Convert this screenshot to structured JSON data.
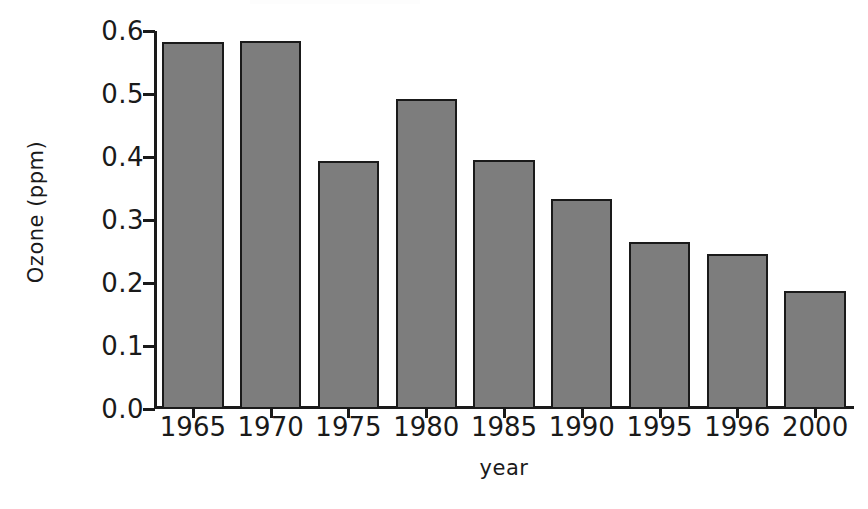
{
  "chart_data": {
    "type": "bar",
    "title": "",
    "xlabel": "year",
    "ylabel": "Ozone (ppm)",
    "categories": [
      "1965",
      "1970",
      "1975",
      "1980",
      "1985",
      "1990",
      "1995",
      "1996",
      "2000"
    ],
    "values": [
      0.583,
      0.584,
      0.393,
      0.492,
      0.395,
      0.334,
      0.265,
      0.246,
      0.187
    ],
    "ylim": [
      0.0,
      0.6
    ],
    "ytick_labels": [
      "0.6",
      "0.5",
      "0.4",
      "0.3",
      "0.2",
      "0.1",
      "0.0"
    ],
    "ytick_values": [
      0.6,
      0.5,
      0.4,
      0.3,
      0.2,
      0.1,
      0.0
    ],
    "grid": false,
    "legend": null,
    "series": [
      {
        "name": "Ozone",
        "values": [
          0.583,
          0.584,
          0.393,
          0.492,
          0.395,
          0.334,
          0.265,
          0.246,
          0.187
        ]
      }
    ]
  },
  "style": {
    "bar_fill": "#7d7d7d",
    "bar_edge": "#1a1a1a",
    "axis_color": "#1a1a1a",
    "background": "#ffffff",
    "text_color": "#1a1a1a"
  }
}
